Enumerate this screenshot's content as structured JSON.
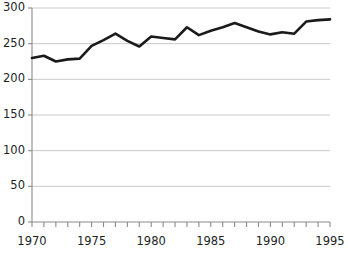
{
  "chart_data": {
    "type": "line",
    "title": "",
    "subtitle": "",
    "xlabel": "",
    "ylabel": "",
    "xlim": [
      1970,
      1995
    ],
    "ylim": [
      0,
      300
    ],
    "grid": true,
    "grid_axis": "y",
    "legend": false,
    "legend_position": "none",
    "line_color": "#1a1a1a",
    "line_width": 2.6,
    "grid_color": "#c9c9c9",
    "axis_color": "#8a8a8a",
    "text_color": "#221f1f",
    "background_color": "#ffffff",
    "x": [
      1970,
      1971,
      1972,
      1973,
      1974,
      1975,
      1976,
      1977,
      1978,
      1979,
      1980,
      1981,
      1982,
      1983,
      1984,
      1985,
      1986,
      1987,
      1988,
      1989,
      1990,
      1991,
      1992,
      1993,
      1994,
      1995
    ],
    "values": [
      230,
      233,
      225,
      228,
      229,
      247,
      255,
      264,
      254,
      246,
      260,
      258,
      256,
      273,
      262,
      268,
      273,
      279,
      273,
      267,
      263,
      266,
      264,
      281,
      283,
      284
    ],
    "series": [
      {
        "name": "series-1",
        "values": [
          230,
          233,
          225,
          228,
          229,
          247,
          255,
          264,
          254,
          246,
          260,
          258,
          256,
          273,
          262,
          268,
          273,
          279,
          273,
          267,
          263,
          266,
          264,
          281,
          283,
          284
        ]
      }
    ],
    "ytick_values": [
      0,
      50,
      100,
      150,
      200,
      250,
      300
    ],
    "ytick_labels": [
      "0",
      "50",
      "100",
      "150",
      "200",
      "250",
      "300"
    ],
    "xtick_values": [
      1970,
      1971,
      1972,
      1973,
      1974,
      1975,
      1976,
      1977,
      1978,
      1979,
      1980,
      1981,
      1982,
      1983,
      1984,
      1985,
      1986,
      1987,
      1988,
      1989,
      1990,
      1991,
      1992,
      1993,
      1994,
      1995
    ],
    "xtick_labeled_values": [
      1970,
      1975,
      1980,
      1985,
      1990,
      1995
    ],
    "xtick_labels": [
      "1970",
      "1975",
      "1980",
      "1985",
      "1990",
      "1995"
    ]
  }
}
